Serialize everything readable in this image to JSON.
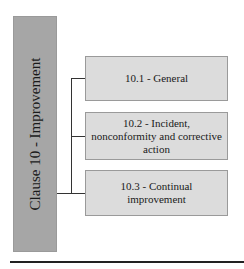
{
  "diagram": {
    "main": {
      "label": "Clause 10 - Improvement",
      "color": "#a6a6a6"
    },
    "children": [
      {
        "label": "10.1 - General"
      },
      {
        "label": "10.2 - Incident, nonconformity and corrective action"
      },
      {
        "label": "10.3 - Continual improvement"
      }
    ],
    "box_color": "#dcdcdc",
    "connector_color": "#333333"
  }
}
